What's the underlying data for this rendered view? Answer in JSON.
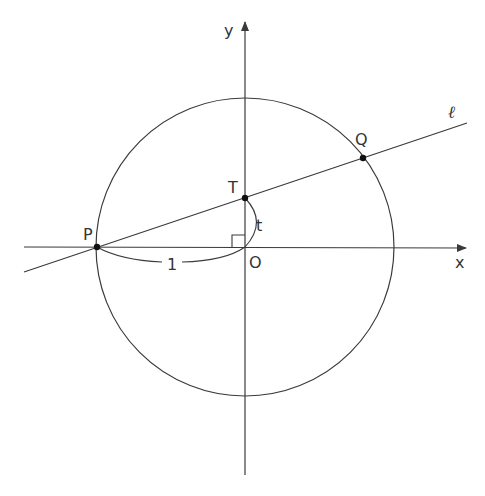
{
  "diagram": {
    "colors": {
      "stroke": "#3a3a3a",
      "point": "#111111",
      "background": "#ffffff"
    },
    "axes": {
      "x_label": "x",
      "y_label": "y",
      "origin_label": "O"
    },
    "circle": {
      "center": "O",
      "radius_label": "1"
    },
    "line": {
      "label": "ℓ",
      "passes_through": [
        "P",
        "T",
        "Q"
      ]
    },
    "points": {
      "P": {
        "label": "P"
      },
      "T": {
        "label": "T"
      },
      "Q": {
        "label": "Q"
      },
      "O": {
        "label": "O"
      }
    },
    "measures": {
      "PO": "1",
      "OT": "t"
    },
    "right_angle_at": "O"
  }
}
